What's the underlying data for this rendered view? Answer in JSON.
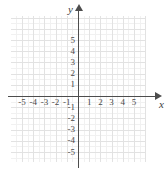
{
  "figure": {
    "type": "cartesian-coordinate-plane",
    "axis_labels": {
      "x": "x",
      "y": "y"
    },
    "x_ticks": [
      "-5",
      "-4",
      "-3",
      "-2",
      "-1",
      "1",
      "2",
      "3",
      "4",
      "5"
    ],
    "y_ticks": [
      "5",
      "4",
      "3",
      "2",
      "1",
      "-1",
      "-2",
      "-3",
      "-4",
      "-5"
    ],
    "colors": {
      "axis": "#4d4d4d",
      "grid_major": "#e2e2e2",
      "grid_minor": "#f1f1f1",
      "label": "#4a4a4a",
      "background": "#ffffff"
    }
  },
  "chart_data": {
    "type": "scatter",
    "title": "",
    "xlabel": "x",
    "ylabel": "y",
    "x": [],
    "y": [],
    "series": [],
    "xlim": [
      -6,
      6
    ],
    "ylim": [
      -6,
      6
    ],
    "xticks": [
      -5,
      -4,
      -3,
      -2,
      -1,
      1,
      2,
      3,
      4,
      5
    ],
    "yticks": [
      5,
      4,
      3,
      2,
      1,
      -1,
      -2,
      -3,
      -4,
      -5
    ],
    "grid": true,
    "minor_grid": true,
    "legend": "none",
    "annotations": []
  }
}
